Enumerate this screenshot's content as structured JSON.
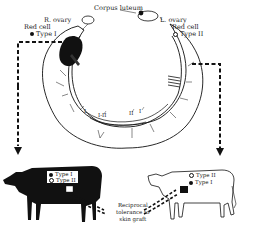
{
  "diagram": {
    "labels": {
      "corpus_luteum": "Corpus luteum",
      "right_ovary": "R. ovary",
      "left_ovary": "L. ovary",
      "left_red_cell_title": "Red cell",
      "left_red_cell_type": "Type I",
      "right_red_cell_title": "Red cell",
      "right_red_cell_type": "Type II",
      "vessel_label_1": "I",
      "vessel_label_2": "I-II",
      "vessel_label_3": "II",
      "vessel_label_4": "I",
      "tolerance_line1": "Reciprocal",
      "tolerance_line2": "tolerance to",
      "tolerance_line3": "skin graft"
    },
    "black_cow": {
      "type1": "Type I",
      "type2": "Type II",
      "type1_marker": "filled",
      "type2_marker": "open"
    },
    "white_cow": {
      "type1": "Type II",
      "type2": "Type I",
      "type1_marker": "open",
      "type2_marker": "filled"
    },
    "colors": {
      "ink": "#111111",
      "background": "#ffffff"
    }
  }
}
